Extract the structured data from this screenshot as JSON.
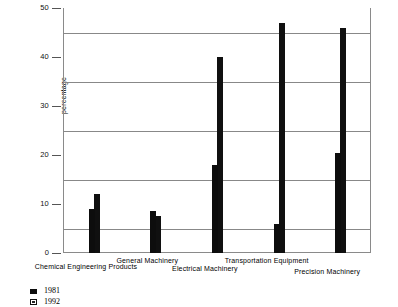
{
  "chart_data": {
    "type": "bar",
    "title": "",
    "xlabel": "",
    "ylabel": "percentage",
    "ylim": [
      0,
      50
    ],
    "ytick_labels": [
      "0",
      "10",
      "20",
      "30",
      "40",
      "50"
    ],
    "ytick_values": [
      0,
      10,
      20,
      30,
      40,
      50
    ],
    "gridlines": [
      5,
      15,
      25,
      35,
      45
    ],
    "grid": true,
    "legend_position": "below-left",
    "categories": [
      "Chemical Engineering Products",
      "General Machinery",
      "Electrical Machinery",
      "Transportation Equipment",
      "Precision Machinery"
    ],
    "series": [
      {
        "name": "1981",
        "values": [
          9,
          8.5,
          18,
          6,
          20.5
        ],
        "color": "#0d0d0d"
      },
      {
        "name": "1992",
        "values": [
          12,
          7.5,
          40,
          47,
          46
        ],
        "color": "#6e6e6e"
      }
    ]
  },
  "legend": {
    "items": [
      {
        "label": "1981",
        "swatch": "solid-black-swatch"
      },
      {
        "label": "1992",
        "swatch": "hatched-square-swatch"
      }
    ]
  }
}
